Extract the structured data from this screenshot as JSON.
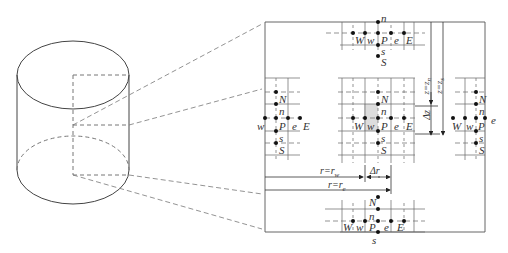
{
  "figure": {
    "type": "finite-volume staggered grid schematic (cylindrical coordinates)",
    "cylinder": {
      "label": "cylinder domain"
    },
    "top_stencil": {
      "nodes": [
        "W",
        "w",
        "P",
        "e",
        "E"
      ],
      "vertical": [
        "n",
        "s",
        "S"
      ]
    },
    "left_stencil": {
      "nodes": [
        "w",
        "P",
        "e",
        "E"
      ],
      "vertical": [
        "N",
        "n",
        "s",
        "S"
      ]
    },
    "center_stencil": {
      "nodes": [
        "W",
        "w",
        "P",
        "e",
        "E"
      ],
      "vertical": [
        "N",
        "n",
        "s",
        "S"
      ]
    },
    "right_stencil": {
      "nodes": [
        "W",
        "w",
        "P",
        "e"
      ],
      "vertical": [
        "N",
        "n",
        "s",
        "S"
      ]
    },
    "bottom_stencil": {
      "nodes": [
        "W",
        "w",
        "P",
        "e",
        "E"
      ],
      "vertical": [
        "N",
        "n",
        "s"
      ]
    },
    "dimensions": {
      "r_w": "r=r",
      "r_w_sub": "w",
      "r_e": "r=r",
      "r_e_sub": "e",
      "delta_r": "Δr",
      "delta_z": "Δz",
      "z_n": "z=z",
      "z_n_sub": "n",
      "z_s": "z=z",
      "z_s_sub": "s"
    }
  },
  "labels": {
    "W": "W",
    "w": "w",
    "P": "P",
    "e": "e",
    "E": "E",
    "N": "N",
    "n": "n",
    "s": "s",
    "S": "S"
  }
}
